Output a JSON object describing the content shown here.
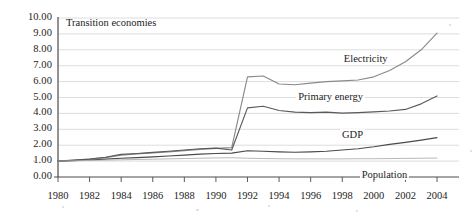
{
  "panel": {
    "title": "Transition economies"
  },
  "chart_data": {
    "type": "line",
    "title": "Transition economies",
    "xlabel": "",
    "ylabel": "",
    "xlim": [
      1980,
      2004
    ],
    "ylim": [
      0.0,
      10.0
    ],
    "grid": true,
    "legend": "inline-curve-labels",
    "y_ticks": [
      "0.00",
      "1.00",
      "2.00",
      "3.00",
      "4.00",
      "5.00",
      "6.00",
      "7.00",
      "8.00",
      "9.00",
      "10.00"
    ],
    "x_ticks": [
      "1980",
      "1982",
      "1984",
      "1986",
      "1988",
      "1990",
      "1992",
      "1994",
      "1996",
      "1998",
      "2000",
      "2002",
      "2004"
    ],
    "x": [
      1980,
      1981,
      1982,
      1983,
      1984,
      1985,
      1986,
      1987,
      1988,
      1989,
      1990,
      1991,
      1992,
      1993,
      1994,
      1995,
      1996,
      1997,
      1998,
      1999,
      2000,
      2001,
      2002,
      2003,
      2004
    ],
    "series": [
      {
        "name": "Electricity",
        "color": "#8a8a8a",
        "label_x": 2000,
        "values": [
          1.0,
          1.05,
          1.12,
          1.22,
          1.38,
          1.45,
          1.52,
          1.58,
          1.66,
          1.74,
          1.8,
          1.85,
          6.3,
          6.35,
          5.85,
          5.8,
          5.9,
          6.0,
          6.05,
          6.1,
          6.3,
          6.7,
          7.25,
          8.0,
          9.05
        ]
      },
      {
        "name": "Primary energy",
        "color": "#5a5a5a",
        "label_x": 1998,
        "values": [
          1.0,
          1.06,
          1.13,
          1.24,
          1.42,
          1.48,
          1.55,
          1.62,
          1.7,
          1.78,
          1.82,
          1.7,
          4.35,
          4.45,
          4.18,
          4.08,
          4.05,
          4.08,
          4.02,
          4.05,
          4.1,
          4.15,
          4.25,
          4.6,
          5.1
        ]
      },
      {
        "name": "GDP",
        "color": "#4a4a4a",
        "label_x": 1999,
        "values": [
          1.0,
          1.03,
          1.07,
          1.12,
          1.18,
          1.22,
          1.27,
          1.32,
          1.38,
          1.44,
          1.48,
          1.5,
          1.65,
          1.62,
          1.58,
          1.56,
          1.58,
          1.62,
          1.7,
          1.78,
          1.9,
          2.05,
          2.18,
          2.32,
          2.48
        ]
      },
      {
        "name": "Population",
        "color": "#b0b0b0",
        "label_x": 2001,
        "values": [
          1.0,
          1.02,
          1.04,
          1.06,
          1.08,
          1.1,
          1.12,
          1.14,
          1.16,
          1.18,
          1.2,
          1.21,
          1.18,
          1.16,
          1.15,
          1.14,
          1.14,
          1.14,
          1.14,
          1.15,
          1.15,
          1.16,
          1.17,
          1.18,
          1.19
        ]
      }
    ]
  }
}
